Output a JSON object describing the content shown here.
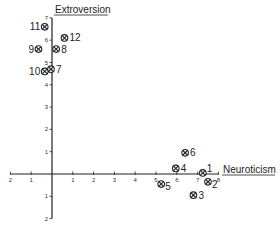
{
  "chart_data": {
    "type": "scatter",
    "title": "",
    "xlabel": "Neuroticism",
    "ylabel": "Extroversion",
    "xlim": [
      -2,
      8
    ],
    "ylim": [
      -2,
      7
    ],
    "x_ticks": [
      -2,
      -1,
      1,
      2,
      3,
      4,
      5,
      6,
      7,
      8
    ],
    "y_ticks": [
      -2,
      -1,
      1,
      2,
      3,
      4,
      5,
      6,
      7
    ],
    "grid": false,
    "marker": "circled-x",
    "points": [
      {
        "label": "1",
        "x": 7.25,
        "y": 0.05
      },
      {
        "label": "2",
        "x": 7.5,
        "y": -0.35
      },
      {
        "label": "3",
        "x": 6.8,
        "y": -0.95
      },
      {
        "label": "4",
        "x": 5.95,
        "y": 0.25
      },
      {
        "label": "5",
        "x": 5.25,
        "y": -0.45
      },
      {
        "label": "6",
        "x": 6.4,
        "y": 0.95
      },
      {
        "label": "7",
        "x": -0.05,
        "y": 4.7
      },
      {
        "label": "8",
        "x": 0.2,
        "y": 5.6
      },
      {
        "label": "9",
        "x": -0.65,
        "y": 5.6
      },
      {
        "label": "10",
        "x": -0.35,
        "y": 4.6
      },
      {
        "label": "11",
        "x": -0.35,
        "y": 6.6
      },
      {
        "label": "12",
        "x": 0.6,
        "y": 6.1
      }
    ]
  },
  "labels": {
    "x_axis": "Neuroticism",
    "y_axis": "Extroversion"
  },
  "layout": {
    "origin_px": [
      52,
      174
    ],
    "x_unit_px": 20.8,
    "y_unit_px": 22.3,
    "label_side": {
      "1": "right-up",
      "2": "right-down",
      "3": "right",
      "4": "right",
      "5": "right-down",
      "6": "right",
      "7": "right",
      "8": "right",
      "9": "left",
      "10": "left",
      "11": "left",
      "12": "right"
    }
  }
}
